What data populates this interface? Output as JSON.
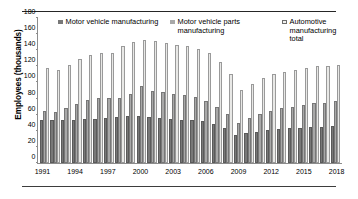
{
  "chart_data": {
    "type": "bar",
    "title": "",
    "subtitle": "",
    "xlabel": "",
    "ylabel": "Employees (thousands)",
    "ylim": [
      0,
      180
    ],
    "ytick_step": 20,
    "yticks": [
      0,
      20,
      40,
      60,
      80,
      100,
      120,
      140,
      160,
      180
    ],
    "grid": false,
    "legend_position": "top",
    "x_tick_labels": [
      "1991",
      "1994",
      "1997",
      "2000",
      "2003",
      "2006",
      "2009",
      "2012",
      "2015",
      "2018"
    ],
    "x_tick_interval": 3,
    "categories": [
      "1991",
      "1992",
      "1993",
      "1994",
      "1995",
      "1996",
      "1997",
      "1998",
      "1999",
      "2000",
      "2001",
      "2002",
      "2003",
      "2004",
      "2005",
      "2006",
      "2007",
      "2008",
      "2009",
      "2010",
      "2011",
      "2012",
      "2013",
      "2014",
      "2015",
      "2016",
      "2017",
      "2018"
    ],
    "series": [
      {
        "name": "Motor vehicle manufacturing",
        "color": "#787878",
        "values": [
          53,
          53,
          53,
          54,
          55,
          55,
          56,
          57,
          58,
          58,
          57,
          56,
          55,
          54,
          53,
          52,
          49,
          43,
          35,
          37,
          39,
          41,
          42,
          43,
          44,
          45,
          45,
          46
        ]
      },
      {
        "name": "Motor vehicle parts manufacturing",
        "color": "#a8a8a8",
        "values": [
          65,
          63,
          68,
          73,
          78,
          81,
          81,
          81,
          86,
          95,
          89,
          88,
          86,
          84,
          82,
          77,
          70,
          61,
          50,
          56,
          61,
          65,
          68,
          70,
          72,
          74,
          75,
          77
        ]
      },
      {
        "name": "Automotive manufacturing total",
        "color": "#e8e8e6",
        "values": [
          118,
          116,
          122,
          129,
          134,
          137,
          136,
          145,
          150,
          153,
          152,
          149,
          147,
          145,
          142,
          136,
          125,
          110,
          91,
          98,
          105,
          110,
          113,
          116,
          118,
          120,
          121,
          122
        ]
      }
    ]
  },
  "legend": {
    "items": [
      {
        "label": "Motor vehicle manufacturing",
        "swatch": "series-0-swatch"
      },
      {
        "label": "Motor vehicle parts manufacturing",
        "swatch": "series-1-swatch"
      },
      {
        "label": "Automotive manufacturing total",
        "swatch": "series-2-swatch"
      }
    ]
  },
  "axis": {
    "y_title": "Employees (thousands)"
  }
}
